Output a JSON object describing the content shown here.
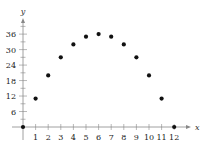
{
  "chart_data": {
    "type": "scatter",
    "title": "",
    "xlabel": "x",
    "ylabel": "y",
    "x": [
      0,
      1,
      2,
      3,
      4,
      5,
      6,
      7,
      8,
      9,
      10,
      11,
      12
    ],
    "series": [
      {
        "name": "points",
        "values": [
          0,
          11,
          20,
          27,
          32,
          35,
          36,
          35,
          32,
          27,
          20,
          11,
          0
        ]
      }
    ],
    "xticks": [
      1,
      2,
      3,
      4,
      5,
      6,
      7,
      8,
      9,
      10,
      11,
      12
    ],
    "yticks": [
      6,
      12,
      18,
      24,
      30,
      36
    ],
    "xlim": [
      0,
      12
    ],
    "ylim": [
      0,
      36
    ],
    "grid": false,
    "legend": null
  },
  "axes": {
    "x_label": "x",
    "y_label": "y",
    "x_tick_labels": [
      "1",
      "2",
      "3",
      "4",
      "5",
      "6",
      "7",
      "8",
      "9",
      "10",
      "11",
      "12"
    ],
    "y_tick_labels": [
      "6",
      "12",
      "18",
      "24",
      "30",
      "36"
    ]
  },
  "colors": {
    "point": "#111111",
    "axis": "#888888",
    "text": "#222222"
  }
}
